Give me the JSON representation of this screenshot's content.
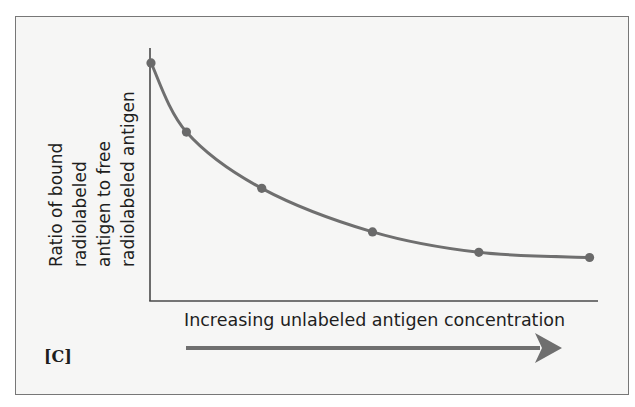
{
  "chart_data": {
    "type": "line",
    "title": "",
    "panel_label": "[C]",
    "xlabel": "Increasing unlabeled antigen concentration",
    "ylabel_lines": [
      "Ratio of bound",
      "radiolabeled",
      "antigen to free",
      "radiolabeled antigen"
    ],
    "ylabel": "Ratio of bound radiolabeled antigen to free radiolabeled antigen",
    "x_ticks": [],
    "y_ticks": [],
    "grid": false,
    "legend": null,
    "x_direction_arrow": true,
    "series": [
      {
        "name": "Bound/free ratio",
        "x": [
          0.0,
          0.08,
          0.25,
          0.5,
          0.74,
          0.99
        ],
        "values": [
          0.93,
          0.66,
          0.44,
          0.27,
          0.19,
          0.17
        ],
        "marker": "circle",
        "smooth": true
      }
    ],
    "xlim": [
      0,
      1
    ],
    "ylim": [
      0,
      1
    ]
  },
  "colors": {
    "curve": "#6f6f6f",
    "points": "#6a6a6a",
    "axis": "#4a4a4a",
    "arrow": "#6f6f6f",
    "frame_bg": "#f6f6f5",
    "frame_border": "#777777",
    "text": "#1e1e1e"
  }
}
